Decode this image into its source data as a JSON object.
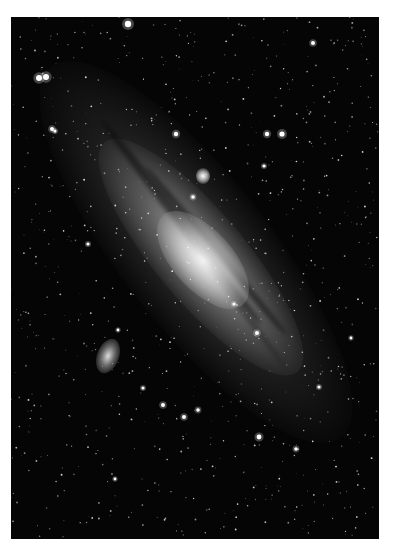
{
  "image": {
    "subject": "Andromeda galaxy with companion galaxies",
    "frame_color": "#ffffff",
    "sky_color": "#050505",
    "galaxy_core_color": "#f5f5f5",
    "features": [
      {
        "name": "galaxy-core",
        "x": 203,
        "y": 260
      },
      {
        "name": "companion-galaxy-m32",
        "x": 203,
        "y": 176
      },
      {
        "name": "companion-galaxy-m110",
        "x": 108,
        "y": 356
      }
    ],
    "bright_stars": [
      {
        "x": 128,
        "y": 24,
        "r": 3.2
      },
      {
        "x": 39,
        "y": 78,
        "r": 3
      },
      {
        "x": 46,
        "y": 77,
        "r": 3
      },
      {
        "x": 282,
        "y": 134,
        "r": 2.6
      },
      {
        "x": 267,
        "y": 134,
        "r": 2.2
      },
      {
        "x": 176,
        "y": 134,
        "r": 2.2
      },
      {
        "x": 259,
        "y": 437,
        "r": 2.4
      },
      {
        "x": 313,
        "y": 43,
        "r": 2
      },
      {
        "x": 52,
        "y": 129,
        "r": 2
      },
      {
        "x": 55,
        "y": 131,
        "r": 1.6
      },
      {
        "x": 163,
        "y": 405,
        "r": 2
      },
      {
        "x": 184,
        "y": 417,
        "r": 2
      },
      {
        "x": 198,
        "y": 410,
        "r": 1.8
      },
      {
        "x": 296,
        "y": 449,
        "r": 1.8
      },
      {
        "x": 319,
        "y": 387,
        "r": 1.6
      },
      {
        "x": 257,
        "y": 333,
        "r": 2
      },
      {
        "x": 193,
        "y": 197,
        "r": 1.8
      },
      {
        "x": 234,
        "y": 304,
        "r": 1.6
      },
      {
        "x": 264,
        "y": 166,
        "r": 1.6
      },
      {
        "x": 351,
        "y": 338,
        "r": 1.4
      },
      {
        "x": 115,
        "y": 479,
        "r": 1.4
      },
      {
        "x": 88,
        "y": 244,
        "r": 1.6
      },
      {
        "x": 118,
        "y": 330,
        "r": 1.4
      },
      {
        "x": 143,
        "y": 388,
        "r": 1.6
      }
    ]
  }
}
